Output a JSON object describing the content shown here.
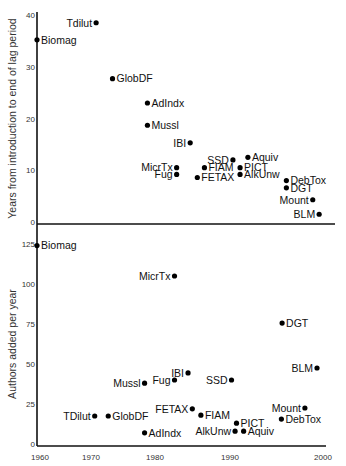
{
  "chart_data": [
    {
      "type": "scatter",
      "title": "",
      "xlabel": "",
      "ylabel": "Years from introduction to end of lag period",
      "xlim": [
        1960,
        2000
      ],
      "ylim": [
        0,
        40
      ],
      "yticks": [
        0,
        10,
        20,
        30,
        40
      ],
      "grid": false,
      "points": [
        {
          "label": "Tdilut",
          "x": 1968.3,
          "y": 38.5,
          "label_side": "left"
        },
        {
          "label": "Biomag",
          "x": 1960,
          "y": 35.2,
          "label_side": "right"
        },
        {
          "label": "GlobDF",
          "x": 1970.6,
          "y": 27.7,
          "label_side": "right"
        },
        {
          "label": "AdIndx",
          "x": 1975.5,
          "y": 23,
          "label_side": "right"
        },
        {
          "label": "Mussl",
          "x": 1975.5,
          "y": 18.7,
          "label_side": "right"
        },
        {
          "label": "IBI",
          "x": 1981.5,
          "y": 15.3,
          "label_side": "left"
        },
        {
          "label": "MicrTx",
          "x": 1979.6,
          "y": 10.5,
          "label_side": "left"
        },
        {
          "label": "Fug",
          "x": 1979.6,
          "y": 9.2,
          "label_side": "left"
        },
        {
          "label": "FIAM",
          "x": 1983.5,
          "y": 10.5,
          "label_side": "right"
        },
        {
          "label": "FETAX",
          "x": 1982.5,
          "y": 8.6,
          "label_side": "right"
        },
        {
          "label": "SSD",
          "x": 1987.5,
          "y": 12,
          "label_side": "left"
        },
        {
          "label": "Aquiv",
          "x": 1989.6,
          "y": 12.5,
          "label_side": "right"
        },
        {
          "label": "PICT",
          "x": 1988.5,
          "y": 10.5,
          "label_side": "right"
        },
        {
          "label": "AlkUnw",
          "x": 1988.5,
          "y": 9.2,
          "label_side": "right"
        },
        {
          "label": "DebTox",
          "x": 1995,
          "y": 8,
          "label_side": "right"
        },
        {
          "label": "DGT",
          "x": 1995,
          "y": 6.6,
          "label_side": "right"
        },
        {
          "label": "Mount",
          "x": 1998.7,
          "y": 4.3,
          "label_side": "left"
        },
        {
          "label": "BLM",
          "x": 1999.6,
          "y": 1.5,
          "label_side": "left"
        }
      ]
    },
    {
      "type": "scatter",
      "title": "",
      "xlabel": "",
      "ylabel": "Authors added per year",
      "xlim": [
        1960,
        2000
      ],
      "ylim": [
        0,
        125
      ],
      "xticks": [
        1960,
        1970,
        1980,
        1990,
        2000
      ],
      "yticks": [
        0,
        25,
        50,
        75,
        100,
        125
      ],
      "grid": false,
      "points": [
        {
          "label": "Biomag",
          "x": 1960,
          "y": 124,
          "label_side": "right"
        },
        {
          "label": "MicrTx",
          "x": 1979.3,
          "y": 105,
          "label_side": "left"
        },
        {
          "label": "DGT",
          "x": 1994.4,
          "y": 75.6,
          "label_side": "right"
        },
        {
          "label": "BLM",
          "x": 1999.3,
          "y": 47.5,
          "label_side": "left"
        },
        {
          "label": "IBI",
          "x": 1981.2,
          "y": 44.4,
          "label_side": "left"
        },
        {
          "label": "SSD",
          "x": 1987.3,
          "y": 40,
          "label_side": "left"
        },
        {
          "label": "Fug",
          "x": 1979.3,
          "y": 40,
          "label_side": "left"
        },
        {
          "label": "Mussl",
          "x": 1975.1,
          "y": 38,
          "label_side": "left"
        },
        {
          "label": "Mount",
          "x": 1997.6,
          "y": 22.5,
          "label_side": "left"
        },
        {
          "label": "FETAX",
          "x": 1981.8,
          "y": 22,
          "label_side": "left"
        },
        {
          "label": "FIAM",
          "x": 1983,
          "y": 18,
          "label_side": "right"
        },
        {
          "label": "TDilut",
          "x": 1968.1,
          "y": 17.5,
          "label_side": "left"
        },
        {
          "label": "GlobDF",
          "x": 1970,
          "y": 17.5,
          "label_side": "right"
        },
        {
          "label": "DebTox",
          "x": 1994.3,
          "y": 15.6,
          "label_side": "right"
        },
        {
          "label": "PICT",
          "x": 1988,
          "y": 13,
          "label_side": "right"
        },
        {
          "label": "AlkUnw",
          "x": 1987.8,
          "y": 8,
          "label_side": "left"
        },
        {
          "label": "Aquiv",
          "x": 1989,
          "y": 8,
          "label_side": "right"
        },
        {
          "label": "AdIndx",
          "x": 1975.1,
          "y": 7,
          "label_side": "right"
        }
      ]
    }
  ],
  "panels_layout": [
    {
      "x0": 37,
      "x1": 322,
      "y_top": 15,
      "y_bottom": 222,
      "axis_y": 224,
      "axis_x_end": 335,
      "vaxis_top": 12,
      "ylabel_x": 16
    },
    {
      "x0": 37,
      "x1": 322,
      "y_top": 244,
      "y_bottom": 444,
      "axis_y": 446,
      "axis_x_end": 326,
      "vaxis_top": 224,
      "ylabel_x": 16
    }
  ],
  "xtick_positions": [
    40,
    91,
    155,
    230,
    323
  ],
  "xtick_y": 460
}
